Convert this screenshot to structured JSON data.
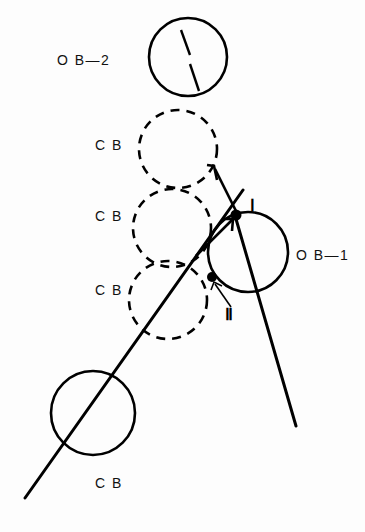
{
  "figure": {
    "background_color": "#fdfdfd",
    "stroke_color": "#000000",
    "width": 365,
    "height": 532
  },
  "labels": {
    "ob2": "O B—2",
    "cb_1": "C B",
    "cb_2": "C B",
    "cb_3": "C B",
    "cb_4": "C B",
    "ob1": "O B—1",
    "point_one": "Ⅰ",
    "point_two": "Ⅱ"
  },
  "balls": [
    {
      "name": "ob2-ball",
      "label": "O B—2",
      "style": "solid",
      "cx": 188,
      "cy": 57,
      "r": 39
    },
    {
      "name": "cb-ball-1",
      "label": "C B",
      "style": "dashed",
      "cx": 178,
      "cy": 149,
      "r": 39
    },
    {
      "name": "cb-ball-2",
      "label": "C B",
      "style": "dashed",
      "cx": 172,
      "cy": 228,
      "r": 39
    },
    {
      "name": "cb-ball-3",
      "label": "C B",
      "style": "dashed",
      "cx": 168,
      "cy": 300,
      "r": 39
    },
    {
      "name": "ob1-ball",
      "label": "O B—1",
      "style": "solid",
      "cx": 248,
      "cy": 252,
      "r": 40
    },
    {
      "name": "cb-ball-4",
      "label": "C B",
      "style": "solid",
      "cx": 93,
      "cy": 413,
      "r": 42
    }
  ],
  "contact_points": [
    {
      "name": "contact-point-one",
      "label": "Ⅰ",
      "x": 236,
      "y": 215
    },
    {
      "name": "contact-point-two",
      "label": "Ⅱ",
      "x": 212,
      "y": 277
    }
  ],
  "label_positions": {
    "ob2": {
      "x": 57,
      "y": 65
    },
    "cb_1": {
      "x": 95,
      "y": 150
    },
    "cb_2": {
      "x": 95,
      "y": 221
    },
    "cb_3": {
      "x": 95,
      "y": 295
    },
    "ob1": {
      "x": 296,
      "y": 260
    },
    "cb_4": {
      "x": 95,
      "y": 488
    },
    "roman_one": {
      "x": 250,
      "y": 210
    },
    "roman_two": {
      "x": 225,
      "y": 318
    }
  },
  "rays": [
    {
      "name": "cue-trajectory-ray",
      "x1": 25,
      "y1": 498,
      "x2": 243,
      "y2": 190
    },
    {
      "name": "object-ball-ray",
      "x1": 236,
      "y1": 219,
      "x2": 296,
      "y2": 426
    }
  ],
  "arrows": [
    {
      "name": "long-momentum-arrow",
      "x1": 237,
      "y1": 213,
      "x2": 214,
      "y2": 166
    },
    {
      "name": "short-momentum-arrow",
      "x1": 196,
      "y1": 256,
      "x2": 233,
      "y2": 219
    },
    {
      "name": "point-two-pointer",
      "x1": 230,
      "y1": 305,
      "x2": 214,
      "y2": 283
    }
  ],
  "ob2_hatch_marks": [
    {
      "name": "ob2-hatch-upper",
      "x1": 181,
      "y1": 30,
      "x2": 190,
      "y2": 55
    },
    {
      "name": "ob2-hatch-lower",
      "x1": 190,
      "y1": 64,
      "x2": 199,
      "y2": 91
    }
  ]
}
